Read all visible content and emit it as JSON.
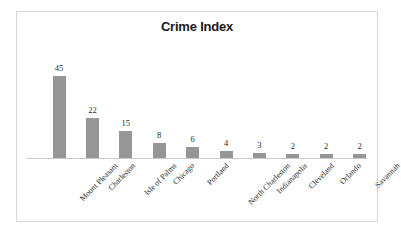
{
  "chart_data": {
    "type": "bar",
    "title": "Crime Index",
    "xlabel": "",
    "ylabel": "",
    "ylim": [
      0,
      48
    ],
    "grid": false,
    "legend": false,
    "bar_color": "#969696",
    "categories": [
      "Mount Pleasant",
      "Charleston",
      "Isle of Palms",
      "Chicago",
      "Portland",
      "North Charleston",
      "Indianapolis",
      "Cleveland",
      "Orlando",
      "Savannah"
    ],
    "values": [
      45,
      22,
      15,
      8,
      6,
      4,
      3,
      2,
      2,
      2
    ],
    "data_labels": [
      "45",
      "22",
      "15",
      "8",
      "6",
      "4",
      "3",
      "2",
      "2",
      "2"
    ]
  },
  "frame": {
    "border_color": "#d6d6d6",
    "background": "#ffffff"
  },
  "axis": {
    "baseline_color": "#c9c9c9"
  }
}
